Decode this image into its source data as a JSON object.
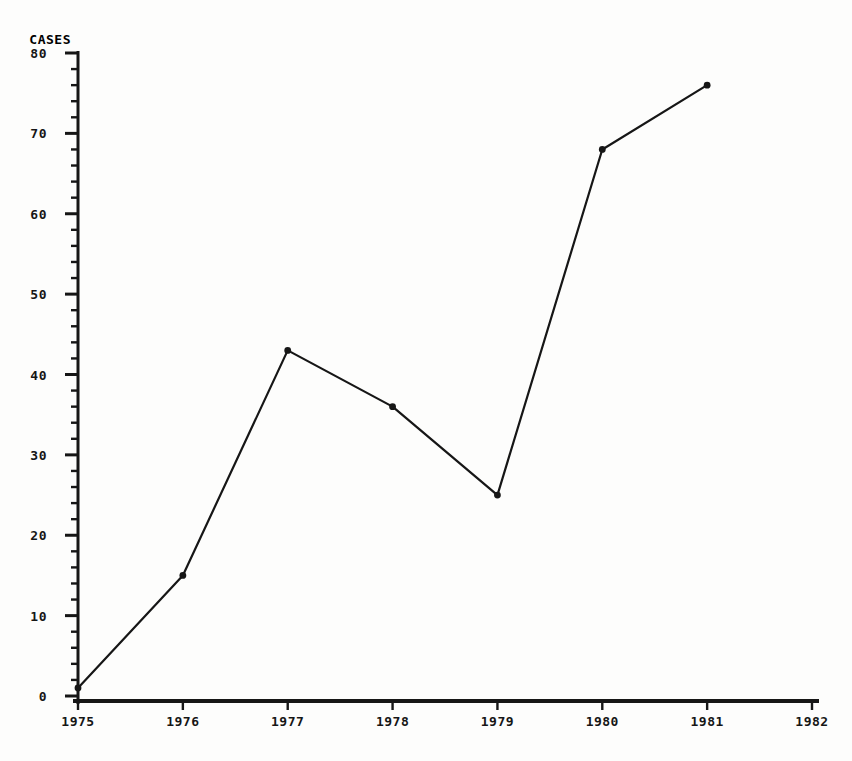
{
  "colors": {
    "ink": "#161616",
    "background": "#fdfdfc"
  },
  "chart_data": {
    "type": "line",
    "title": "",
    "xlabel": "",
    "ylabel": "CASES",
    "x": [
      1975,
      1976,
      1977,
      1978,
      1979,
      1980,
      1981
    ],
    "values": [
      1,
      15,
      43,
      36,
      25,
      68,
      76
    ],
    "series_name": "cases-per-year",
    "xlim": [
      1975,
      1982
    ],
    "ylim": [
      0,
      80
    ],
    "x_tick_labels": [
      "1975",
      "1976",
      "1977",
      "1978",
      "1979",
      "1980",
      "1981",
      "1982"
    ],
    "x_tick_values": [
      1975,
      1976,
      1977,
      1978,
      1979,
      1980,
      1981,
      1982
    ],
    "y_tick_labels": [
      "0",
      "10",
      "20",
      "30",
      "40",
      "50",
      "60",
      "70",
      "80"
    ],
    "y_tick_values": [
      0,
      10,
      20,
      30,
      40,
      50,
      60,
      70,
      80
    ],
    "y_major_step": 10,
    "y_minor_step": 2,
    "grid": false,
    "legend_position": "none",
    "marker": "filled-circle",
    "line_color": "#161616",
    "marker_color": "#161616"
  }
}
